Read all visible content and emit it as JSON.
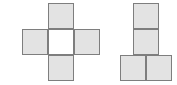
{
  "canvas": {
    "width": 177,
    "height": 85,
    "background_color": "#ffffff"
  },
  "style": {
    "cell_fill_color": "#e3e3e3",
    "cell_empty_fill_color": "#ffffff",
    "cell_border_color": "#7e7e7e",
    "cell_border_width": 1
  },
  "figures": [
    {
      "id": "left-figure",
      "name": "cross-shape",
      "description": "plus shaped arrangement of four shaded squares around an unshaded center square",
      "cell_size": 26,
      "cells": [
        {
          "name": "top-cell",
          "x": 48,
          "y": 3,
          "w": 26,
          "h": 26,
          "filled": true
        },
        {
          "name": "left-cell",
          "x": 22,
          "y": 29,
          "w": 26,
          "h": 26,
          "filled": true
        },
        {
          "name": "center-cell",
          "x": 48,
          "y": 29,
          "w": 26,
          "h": 26,
          "filled": false
        },
        {
          "name": "right-cell",
          "x": 74,
          "y": 29,
          "w": 26,
          "h": 26,
          "filled": true
        },
        {
          "name": "bottom-cell",
          "x": 48,
          "y": 55,
          "w": 26,
          "h": 26,
          "filled": true
        }
      ]
    },
    {
      "id": "right-figure",
      "name": "t-shape",
      "description": "two shaded squares stacked vertically above a two-square shaded bottom row offset to the left",
      "cell_size": 26,
      "cells": [
        {
          "name": "upper-cell",
          "x": 133,
          "y": 3,
          "w": 26,
          "h": 26,
          "filled": true
        },
        {
          "name": "middle-cell",
          "x": 133,
          "y": 29,
          "w": 26,
          "h": 26,
          "filled": true
        },
        {
          "name": "bottom-left-cell",
          "x": 120,
          "y": 55,
          "w": 26,
          "h": 26,
          "filled": true
        },
        {
          "name": "bottom-right-cell",
          "x": 146,
          "y": 55,
          "w": 26,
          "h": 26,
          "filled": true
        }
      ]
    }
  ]
}
